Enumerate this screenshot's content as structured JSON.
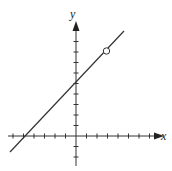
{
  "chart_data": {
    "type": "line",
    "title": "",
    "xlabel": "x",
    "ylabel": "y",
    "xlim": [
      -7,
      6
    ],
    "ylim": [
      -3,
      10
    ],
    "grid": false,
    "series": [
      {
        "name": "line",
        "x": [
          -6.3,
          4.6
        ],
        "y": [
          -1.3,
          9.6
        ],
        "equation": "y = x + 5"
      }
    ],
    "annotations": [
      {
        "type": "open-circle",
        "x": 3,
        "y": 8
      }
    ]
  },
  "axes": {
    "x_label": "x",
    "y_label": "y"
  }
}
